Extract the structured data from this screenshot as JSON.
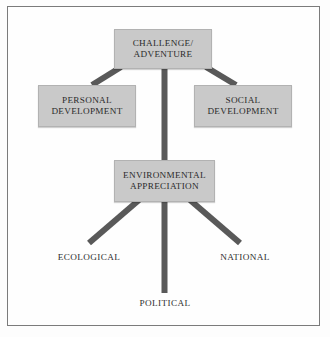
{
  "diagram": {
    "frame": {
      "border_color": "#7b7b7b",
      "background": "#fefefe"
    },
    "palette": {
      "box_fill": "#c9c9c9",
      "box_border": "#b2b2b2",
      "connector": "#595959",
      "text": "#2b2b2b",
      "page_background": "#ffffff"
    },
    "nodes": {
      "challenge": {
        "line1": "CHALLENGE/",
        "line2": "ADVENTURE"
      },
      "personal": {
        "line1": "PERSONAL",
        "line2": "DEVELOPMENT"
      },
      "social": {
        "line1": "SOCIAL",
        "line2": "DEVELOPMENT"
      },
      "environmental": {
        "line1": "ENVIRONMENTAL",
        "line2": "APPRECIATION"
      }
    },
    "leaves": {
      "ecological": "ECOLOGICAL",
      "national": "NATIONAL",
      "political": "POLITICAL"
    },
    "connectors": [
      {
        "name": "challenge-to-personal",
        "from": "challenge",
        "to": "personal",
        "style": "diagonal-left"
      },
      {
        "name": "challenge-to-social",
        "from": "challenge",
        "to": "social",
        "style": "diagonal-right"
      },
      {
        "name": "challenge-to-environmental",
        "from": "challenge",
        "to": "environmental",
        "style": "vertical-trunk"
      },
      {
        "name": "environmental-to-ecological",
        "from": "environmental",
        "to": "ecological",
        "style": "diagonal-left"
      },
      {
        "name": "environmental-to-national",
        "from": "environmental",
        "to": "national",
        "style": "diagonal-right"
      },
      {
        "name": "environmental-to-political",
        "from": "environmental",
        "to": "political",
        "style": "vertical"
      }
    ]
  }
}
